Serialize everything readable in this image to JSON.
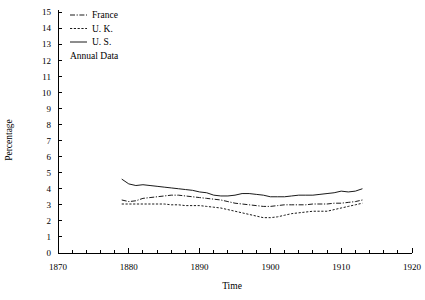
{
  "chart_data": {
    "type": "line",
    "title": "",
    "subtitle": "",
    "xlabel": "Time",
    "ylabel": "Percentage",
    "xlim": [
      1870,
      1920
    ],
    "ylim": [
      0,
      15
    ],
    "xticks": [
      1870,
      1880,
      1890,
      1900,
      1910,
      1920
    ],
    "xtick_labels": [
      "1870",
      "1880",
      "1890",
      "1900",
      "1910",
      "1920"
    ],
    "xminor_step": 2,
    "yticks": [
      0,
      1,
      2,
      3,
      4,
      5,
      6,
      7,
      8,
      9,
      10,
      11,
      12,
      13,
      14,
      15
    ],
    "ytick_labels": [
      "0",
      "1",
      "2",
      "3",
      "4",
      "5",
      "6",
      "7",
      "8",
      "9",
      "10",
      "11",
      "12",
      "13",
      "14",
      "15"
    ],
    "grid": false,
    "legend_position": "top-left",
    "annotations": [
      "Annual Data"
    ],
    "series": [
      {
        "name": "France",
        "style": "dash-dot",
        "color": "#1a1a1a",
        "x": [
          1879,
          1880,
          1881,
          1882,
          1883,
          1884,
          1885,
          1886,
          1887,
          1888,
          1889,
          1890,
          1891,
          1892,
          1893,
          1894,
          1895,
          1896,
          1897,
          1898,
          1899,
          1900,
          1901,
          1902,
          1903,
          1904,
          1905,
          1906,
          1907,
          1908,
          1909,
          1910,
          1911,
          1912,
          1913
        ],
        "values": [
          3.3,
          3.2,
          3.25,
          3.4,
          3.45,
          3.5,
          3.55,
          3.6,
          3.6,
          3.55,
          3.5,
          3.45,
          3.4,
          3.35,
          3.3,
          3.2,
          3.1,
          3.05,
          3.0,
          2.95,
          2.9,
          2.9,
          2.95,
          3.0,
          3.0,
          3.0,
          3.0,
          3.05,
          3.05,
          3.05,
          3.1,
          3.1,
          3.15,
          3.2,
          3.3
        ]
      },
      {
        "name": "U. K.",
        "style": "dashed",
        "color": "#1a1a1a",
        "x": [
          1879,
          1880,
          1881,
          1882,
          1883,
          1884,
          1885,
          1886,
          1887,
          1888,
          1889,
          1890,
          1891,
          1892,
          1893,
          1894,
          1895,
          1896,
          1897,
          1898,
          1899,
          1900,
          1901,
          1902,
          1903,
          1904,
          1905,
          1906,
          1907,
          1908,
          1909,
          1910,
          1911,
          1912,
          1913
        ],
        "values": [
          3.05,
          3.05,
          3.05,
          3.05,
          3.05,
          3.05,
          3.05,
          3.0,
          3.0,
          2.95,
          2.95,
          2.95,
          2.9,
          2.85,
          2.8,
          2.7,
          2.6,
          2.5,
          2.4,
          2.3,
          2.2,
          2.2,
          2.25,
          2.35,
          2.45,
          2.5,
          2.55,
          2.6,
          2.6,
          2.6,
          2.7,
          2.8,
          2.9,
          3.0,
          3.1
        ]
      },
      {
        "name": "U. S.",
        "style": "solid",
        "color": "#1a1a1a",
        "x": [
          1879,
          1880,
          1881,
          1882,
          1883,
          1884,
          1885,
          1886,
          1887,
          1888,
          1889,
          1890,
          1891,
          1892,
          1893,
          1894,
          1895,
          1896,
          1897,
          1898,
          1899,
          1900,
          1901,
          1902,
          1903,
          1904,
          1905,
          1906,
          1907,
          1908,
          1909,
          1910,
          1911,
          1912,
          1913
        ],
        "values": [
          4.6,
          4.3,
          4.2,
          4.25,
          4.2,
          4.15,
          4.1,
          4.05,
          4.0,
          3.95,
          3.9,
          3.8,
          3.75,
          3.6,
          3.55,
          3.55,
          3.6,
          3.7,
          3.7,
          3.65,
          3.6,
          3.5,
          3.5,
          3.5,
          3.55,
          3.6,
          3.6,
          3.6,
          3.65,
          3.7,
          3.75,
          3.85,
          3.8,
          3.85,
          4.0
        ]
      }
    ]
  },
  "legend": {
    "items": [
      {
        "label": "France",
        "style": "dash-dot"
      },
      {
        "label": "U. K.",
        "style": "dashed"
      },
      {
        "label": "U. S.",
        "style": "solid"
      }
    ],
    "note": "Annual Data"
  },
  "axes": {
    "x_title": "Time",
    "y_title": "Percentage"
  }
}
